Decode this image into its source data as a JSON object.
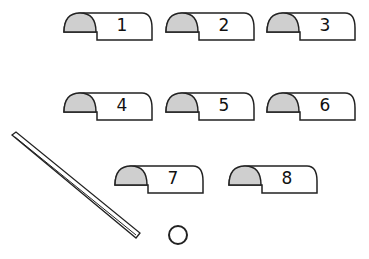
{
  "pieces": [
    {
      "label": "1"
    },
    {
      "label": "2"
    },
    {
      "label": "3"
    },
    {
      "label": "4"
    },
    {
      "label": "5"
    },
    {
      "label": "6"
    },
    {
      "label": "7"
    },
    {
      "label": "8"
    }
  ],
  "colors": {
    "fill": "#cfcfcf",
    "stroke": "#222222"
  }
}
